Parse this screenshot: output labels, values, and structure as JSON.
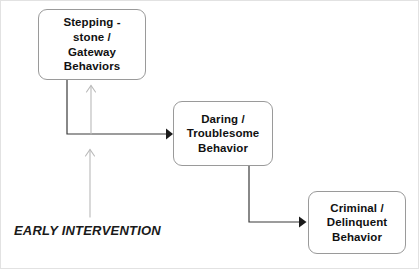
{
  "diagram": {
    "background_color": "#ffffff",
    "node_border_color": "#9a9a9a",
    "connector_color": "#3a3a3a",
    "intervention_arrow_color": "#b6b6b6",
    "nodes": [
      {
        "id": "stepping-stone",
        "label": "Stepping -\nstone /\nGateway\nBehaviors"
      },
      {
        "id": "daring",
        "label": "Daring /\nTroublesome\nBehavior"
      },
      {
        "id": "criminal",
        "label": "Criminal /\nDelinquent\nBehavior"
      }
    ],
    "intervention": {
      "label": "EARLY INTERVENTION"
    }
  }
}
